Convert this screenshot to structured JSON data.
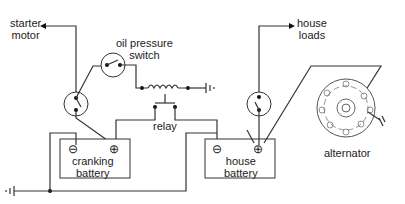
{
  "labels": {
    "starter_motor": [
      "starter",
      "motor"
    ],
    "oil_pressure_switch": [
      "oil pressure",
      "switch"
    ],
    "house_loads": [
      "house",
      "loads"
    ],
    "relay": "relay",
    "cranking_battery": [
      "cranking",
      "battery"
    ],
    "house_battery": [
      "house",
      "battery"
    ],
    "alternator": "alternator"
  },
  "symbols": {
    "negative_terminal": "⊖",
    "positive_terminal": "⊕"
  },
  "colors": {
    "line": "#333333",
    "background": "#ffffff"
  }
}
